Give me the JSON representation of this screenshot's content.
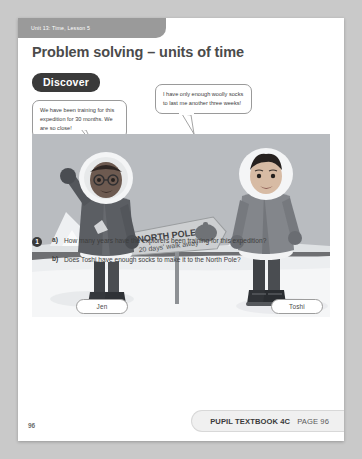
{
  "page": {
    "unit_tab": "Unit 13: Time, Lesson 5",
    "title": "Problem solving – units of time",
    "section_badge": "Discover",
    "page_number": "96"
  },
  "speech": {
    "jen": "We have been training for this expedition for 30 months. We are so close!",
    "toshi": "I have only enough woolly socks to last me another three weeks!"
  },
  "characters": {
    "jen_label": "Jen",
    "toshi_label": "Toshi"
  },
  "illustration": {
    "signpost_line1": "NORTH POLE",
    "signpost_line2": "20 days' walk away",
    "colors": {
      "sky": "#b9bcc0",
      "snow": "#eceef0",
      "water": "#6e6f72",
      "parka_dark": "#5b5e63",
      "parka_light": "#8a8d92",
      "fur": "#f2f3f4",
      "sign": "#c9cbcd"
    }
  },
  "questions": {
    "badge": "1",
    "items": [
      {
        "letter": "a)",
        "text": "How many years have the explorers been training for this expedition?"
      },
      {
        "letter": "b)",
        "text": "Does Toshi have enough socks to make it to the North Pole?"
      }
    ]
  },
  "footer": {
    "book": "PUPIL TEXTBOOK 4C",
    "page": "PAGE 96"
  }
}
